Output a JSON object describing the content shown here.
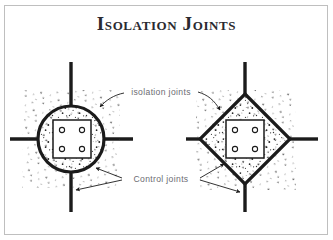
{
  "figure": {
    "title": "Isolation Joints",
    "border_color": "#bfbfbf",
    "background": "#ffffff",
    "ink_color": "#1b1b1b",
    "label_color": "#6c6c72"
  },
  "labels": {
    "isolation_joints": "isolation joints",
    "control_joints": "Control joints"
  },
  "diagrams": [
    {
      "name": "round-isolation-joint",
      "shape": "circle",
      "center": [
        71,
        139
      ],
      "radius": 33,
      "inner_square": {
        "x": 53,
        "y": 120,
        "w": 38,
        "h": 38
      },
      "bolts": [
        [
          62,
          130
        ],
        [
          82,
          130
        ],
        [
          62,
          149
        ],
        [
          82,
          149
        ]
      ],
      "bolt_radius": 2.6,
      "control_joint_lines": [
        "up",
        "down",
        "left",
        "right"
      ],
      "stipple": true
    },
    {
      "name": "diamond-isolation-joint",
      "shape": "diamond",
      "center": [
        245,
        139
      ],
      "half_diagonal": 45,
      "inner_square": {
        "x": 226,
        "y": 120,
        "w": 38,
        "h": 38
      },
      "bolts": [
        [
          235,
          130
        ],
        [
          255,
          130
        ],
        [
          235,
          149
        ],
        [
          255,
          149
        ]
      ],
      "bolt_radius": 2.6,
      "control_joint_lines": [
        "up",
        "down",
        "left",
        "right"
      ],
      "stipple": true
    }
  ],
  "leaders": [
    {
      "name": "isolation-leader-left",
      "target": "circle-upper-right",
      "arrow": true
    },
    {
      "name": "isolation-leader-right",
      "target": "diamond-upper-left",
      "arrow": true
    },
    {
      "name": "control-leader-left-upper",
      "target": "circle-lower-right",
      "arrow": true
    },
    {
      "name": "control-leader-left-lower",
      "target": "circle-bottom-line",
      "arrow": true
    },
    {
      "name": "control-leader-right-upper",
      "target": "diamond-lower-left",
      "arrow": true
    },
    {
      "name": "control-leader-right-lower",
      "target": "diamond-bottom-line",
      "arrow": true
    }
  ]
}
